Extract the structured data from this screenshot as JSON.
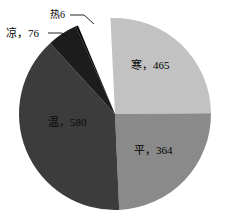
{
  "chart_data": {
    "type": "pie",
    "title": "",
    "subtitle": "",
    "xlabel": "",
    "ylabel": "",
    "legend": "none",
    "grid": false,
    "label_format": "name, value",
    "total": 1491,
    "categories": [
      "寒",
      "平",
      "温",
      "凉",
      "热"
    ],
    "values": [
      465,
      364,
      580,
      76,
      6
    ],
    "colors": [
      "#c2c2c2",
      "#8a8a8a",
      "#3c3c3c",
      "#1c1c1c",
      "#050505"
    ],
    "slices": [
      {
        "name": "寒",
        "value": 465,
        "label": "寒，465",
        "color": "#c2c2c2",
        "label_position": "inside",
        "start_angle_deg": 357.3,
        "end_angle_deg": 89.6
      },
      {
        "name": "平",
        "value": 364,
        "label": "平，364",
        "color": "#8a8a8a",
        "label_position": "inside",
        "start_angle_deg": 89.6,
        "end_angle_deg": 177.5
      },
      {
        "name": "温",
        "value": 580,
        "label": "温，580",
        "color": "#3c3c3c",
        "label_position": "inside",
        "start_angle_deg": 177.5,
        "end_angle_deg": 317.5
      },
      {
        "name": "凉",
        "value": 76,
        "label": "凉，76",
        "color": "#1c1c1c",
        "label_position": "outside-leader",
        "start_angle_deg": 317.5,
        "end_angle_deg": 335.9
      },
      {
        "name": "热",
        "value": 6,
        "label": "热6",
        "color": "#050505",
        "label_position": "outside-leader",
        "start_angle_deg": 335.9,
        "end_angle_deg": 337.3
      }
    ],
    "geometry": {
      "center_x": 115,
      "center_y": 114,
      "radius": 96
    }
  }
}
